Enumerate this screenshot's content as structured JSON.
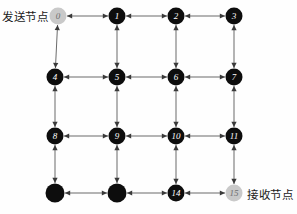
{
  "diagram": {
    "type": "grid-network-graph",
    "width": 297,
    "height": 214,
    "rows": 4,
    "cols": 4,
    "colors": {
      "node_default": "#0d0d0d",
      "node_highlight": "#c9c9c9",
      "node_label_default": "#ffffff",
      "node_label_highlight": "#6e6e6e",
      "edge": "#6b6b6b",
      "arrow": "#3a3a3a",
      "background": "#fefefe",
      "text": "#1a1a1a"
    },
    "nodes": [
      {
        "id": "0",
        "label": "0",
        "x": 58,
        "y": 16,
        "r": 8.5,
        "style": "highlight"
      },
      {
        "id": "1",
        "label": "1",
        "x": 117,
        "y": 16,
        "r": 8.5,
        "style": "default"
      },
      {
        "id": "2",
        "label": "2",
        "x": 176,
        "y": 16,
        "r": 8.5,
        "style": "default"
      },
      {
        "id": "3",
        "label": "3",
        "x": 234,
        "y": 16,
        "r": 8.5,
        "style": "default"
      },
      {
        "id": "4",
        "label": "4",
        "x": 55,
        "y": 77,
        "r": 8.5,
        "style": "default"
      },
      {
        "id": "5",
        "label": "5",
        "x": 117,
        "y": 77,
        "r": 8.5,
        "style": "default"
      },
      {
        "id": "6",
        "label": "6",
        "x": 176,
        "y": 77,
        "r": 8.5,
        "style": "default"
      },
      {
        "id": "7",
        "label": "7",
        "x": 234,
        "y": 77,
        "r": 8.5,
        "style": "default"
      },
      {
        "id": "8",
        "label": "8",
        "x": 55,
        "y": 136,
        "r": 8.5,
        "style": "default"
      },
      {
        "id": "9",
        "label": "9",
        "x": 117,
        "y": 136,
        "r": 8.5,
        "style": "default"
      },
      {
        "id": "10",
        "label": "10",
        "x": 176,
        "y": 136,
        "r": 8.5,
        "style": "default"
      },
      {
        "id": "11",
        "label": "11",
        "x": 234,
        "y": 136,
        "r": 8.5,
        "style": "default"
      },
      {
        "id": "12",
        "label": "",
        "x": 55,
        "y": 193,
        "r": 9.5,
        "style": "default"
      },
      {
        "id": "13",
        "label": "",
        "x": 117,
        "y": 193,
        "r": 9.5,
        "style": "default"
      },
      {
        "id": "14",
        "label": "14",
        "x": 176,
        "y": 193,
        "r": 8.5,
        "style": "default"
      },
      {
        "id": "15",
        "label": "15",
        "x": 234,
        "y": 193,
        "r": 8.5,
        "style": "highlight"
      }
    ],
    "edges": [
      {
        "from": "0",
        "to": "1",
        "bidirectional": true
      },
      {
        "from": "1",
        "to": "2",
        "bidirectional": true
      },
      {
        "from": "2",
        "to": "3",
        "bidirectional": true
      },
      {
        "from": "4",
        "to": "5",
        "bidirectional": true
      },
      {
        "from": "5",
        "to": "6",
        "bidirectional": true
      },
      {
        "from": "6",
        "to": "7",
        "bidirectional": true
      },
      {
        "from": "8",
        "to": "9",
        "bidirectional": true
      },
      {
        "from": "9",
        "to": "10",
        "bidirectional": true
      },
      {
        "from": "10",
        "to": "11",
        "bidirectional": true
      },
      {
        "from": "12",
        "to": "13",
        "bidirectional": true
      },
      {
        "from": "13",
        "to": "14",
        "bidirectional": true
      },
      {
        "from": "14",
        "to": "15",
        "bidirectional": true
      },
      {
        "from": "0",
        "to": "4",
        "bidirectional": true
      },
      {
        "from": "1",
        "to": "5",
        "bidirectional": true
      },
      {
        "from": "2",
        "to": "6",
        "bidirectional": true
      },
      {
        "from": "3",
        "to": "7",
        "bidirectional": true
      },
      {
        "from": "4",
        "to": "8",
        "bidirectional": true
      },
      {
        "from": "5",
        "to": "9",
        "bidirectional": true
      },
      {
        "from": "6",
        "to": "10",
        "bidirectional": true
      },
      {
        "from": "7",
        "to": "11",
        "bidirectional": true
      },
      {
        "from": "8",
        "to": "12",
        "bidirectional": true
      },
      {
        "from": "9",
        "to": "13",
        "bidirectional": true
      },
      {
        "from": "10",
        "to": "14",
        "bidirectional": true
      },
      {
        "from": "11",
        "to": "15",
        "bidirectional": true
      }
    ]
  },
  "labels": {
    "sender": "发送节点",
    "receiver": "接收节点"
  }
}
